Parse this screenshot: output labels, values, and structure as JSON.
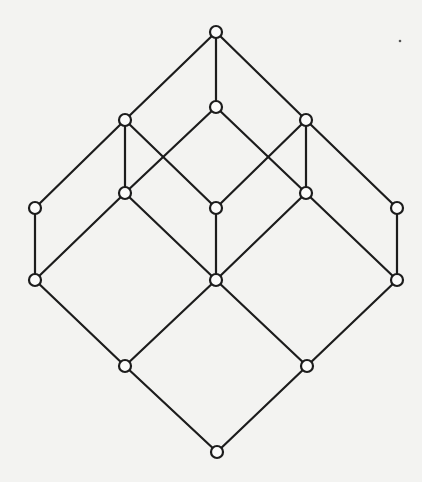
{
  "diagram": {
    "type": "hasse-diagram",
    "colors": {
      "background": "#f3f3f1",
      "line": "#1c1c1c",
      "node_fill": "#fbfbfa"
    },
    "node_radius": 6,
    "nodes": [
      {
        "id": "top",
        "x": 216,
        "y": 32
      },
      {
        "id": "a",
        "x": 125,
        "y": 120
      },
      {
        "id": "m",
        "x": 216,
        "y": 107
      },
      {
        "id": "c",
        "x": 306,
        "y": 120
      },
      {
        "id": "l",
        "x": 35,
        "y": 208
      },
      {
        "id": "b1",
        "x": 125,
        "y": 193
      },
      {
        "id": "cc",
        "x": 216,
        "y": 208
      },
      {
        "id": "b2",
        "x": 306,
        "y": 193
      },
      {
        "id": "r",
        "x": 397,
        "y": 208
      },
      {
        "id": "ll",
        "x": 35,
        "y": 280
      },
      {
        "id": "mm",
        "x": 216,
        "y": 280
      },
      {
        "id": "rr",
        "x": 397,
        "y": 280
      },
      {
        "id": "d1",
        "x": 125,
        "y": 366
      },
      {
        "id": "d2",
        "x": 307,
        "y": 366
      },
      {
        "id": "bot",
        "x": 217,
        "y": 452
      }
    ],
    "edges": [
      [
        "top",
        "a"
      ],
      [
        "top",
        "m"
      ],
      [
        "top",
        "c"
      ],
      [
        "a",
        "l"
      ],
      [
        "a",
        "b1"
      ],
      [
        "a",
        "cc"
      ],
      [
        "m",
        "b1"
      ],
      [
        "m",
        "b2"
      ],
      [
        "c",
        "cc"
      ],
      [
        "c",
        "b2"
      ],
      [
        "c",
        "r"
      ],
      [
        "l",
        "ll"
      ],
      [
        "b1",
        "ll"
      ],
      [
        "b1",
        "mm"
      ],
      [
        "cc",
        "mm"
      ],
      [
        "b2",
        "mm"
      ],
      [
        "b2",
        "rr"
      ],
      [
        "r",
        "rr"
      ],
      [
        "ll",
        "d1"
      ],
      [
        "mm",
        "d1"
      ],
      [
        "mm",
        "d2"
      ],
      [
        "rr",
        "d2"
      ],
      [
        "d1",
        "bot"
      ],
      [
        "d2",
        "bot"
      ]
    ]
  }
}
